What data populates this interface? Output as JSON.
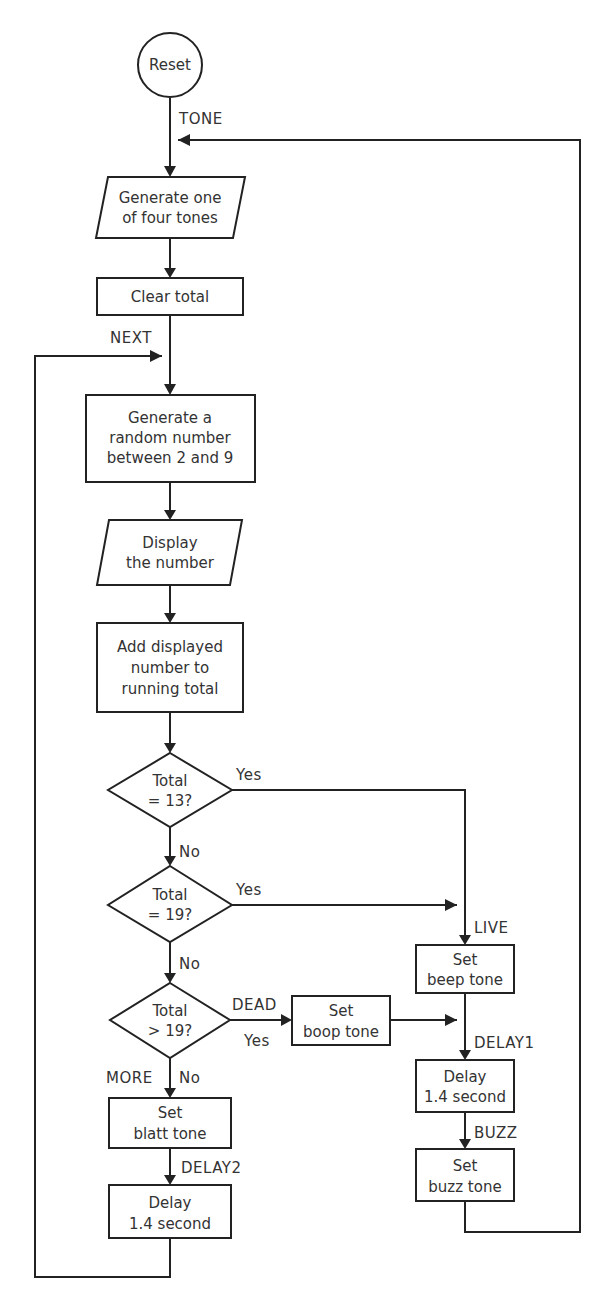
{
  "diagram": {
    "type": "flowchart",
    "start": {
      "label": "Reset"
    },
    "nodes": {
      "generate_tone": {
        "shape": "parallelogram",
        "lines": [
          "Generate one",
          "of four tones"
        ]
      },
      "clear_total": {
        "shape": "rect",
        "lines": [
          "Clear total"
        ]
      },
      "generate_random": {
        "shape": "rect",
        "lines": [
          "Generate a",
          "random number",
          "between 2 and 9"
        ]
      },
      "display_number": {
        "shape": "parallelogram",
        "lines": [
          "Display",
          "the number"
        ]
      },
      "add_total": {
        "shape": "rect",
        "lines": [
          "Add displayed",
          "number to",
          "running total"
        ]
      },
      "decision_13": {
        "shape": "diamond",
        "lines": [
          "Total",
          "= 13?"
        ]
      },
      "decision_19": {
        "shape": "diamond",
        "lines": [
          "Total",
          "= 19?"
        ]
      },
      "decision_gt19": {
        "shape": "diamond",
        "lines": [
          "Total",
          "> 19?"
        ]
      },
      "set_beep": {
        "shape": "rect",
        "lines": [
          "Set",
          "beep tone"
        ]
      },
      "set_boop": {
        "shape": "rect",
        "lines": [
          "Set",
          "boop tone"
        ]
      },
      "delay1": {
        "shape": "rect",
        "lines": [
          "Delay",
          "1.4 second"
        ]
      },
      "set_buzz": {
        "shape": "rect",
        "lines": [
          "Set",
          "buzz tone"
        ]
      },
      "set_blatt": {
        "shape": "rect",
        "lines": [
          "Set",
          "blatt tone"
        ]
      },
      "delay2": {
        "shape": "rect",
        "lines": [
          "Delay",
          "1.4 second"
        ]
      }
    },
    "labels": {
      "tone": "TONE",
      "next": "NEXT",
      "live": "LIVE",
      "dead": "DEAD",
      "delay1": "DELAY1",
      "buzz": "BUZZ",
      "more": "MORE",
      "delay2": "DELAY2"
    },
    "branches": {
      "yes": "Yes",
      "no": "No"
    },
    "edges": [
      [
        "Reset",
        "generate_tone"
      ],
      [
        "generate_tone",
        "clear_total"
      ],
      [
        "clear_total",
        "generate_random"
      ],
      [
        "generate_random",
        "display_number"
      ],
      [
        "display_number",
        "add_total"
      ],
      [
        "add_total",
        "decision_13"
      ],
      [
        "decision_13",
        "set_beep",
        "Yes"
      ],
      [
        "decision_13",
        "decision_19",
        "No"
      ],
      [
        "decision_19",
        "set_beep",
        "Yes"
      ],
      [
        "decision_19",
        "decision_gt19",
        "No"
      ],
      [
        "decision_gt19",
        "set_boop",
        "Yes"
      ],
      [
        "decision_gt19",
        "set_blatt",
        "No"
      ],
      [
        "set_beep",
        "delay1"
      ],
      [
        "set_boop",
        "delay1"
      ],
      [
        "delay1",
        "set_buzz"
      ],
      [
        "set_buzz",
        "generate_tone"
      ],
      [
        "set_blatt",
        "delay2"
      ],
      [
        "delay2",
        "generate_random"
      ]
    ]
  }
}
